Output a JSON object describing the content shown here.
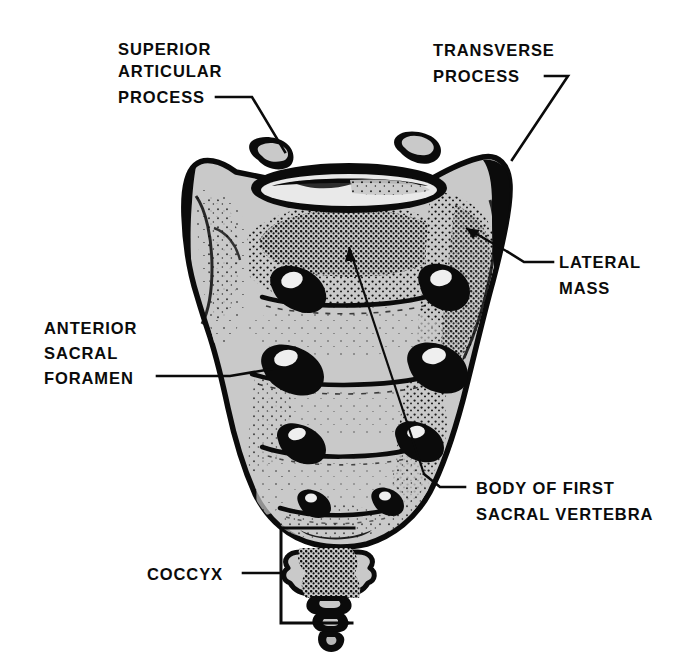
{
  "figure": {
    "background_color": "#ffffff",
    "bone_fill_color": "#c9c9c9",
    "ink_color": "#0b0b0b"
  },
  "labels": {
    "superior_articular_process": {
      "line1": "SUPERIOR",
      "line2": "ARTICULAR",
      "line3": "PROCESS"
    },
    "transverse_process": {
      "line1": "TRANSVERSE",
      "line2": "PROCESS"
    },
    "lateral_mass": {
      "line1": "LATERAL",
      "line2": "MASS"
    },
    "anterior_sacral_foramen": {
      "line1": "ANTERIOR",
      "line2": "SACRAL",
      "line3": "FORAMEN"
    },
    "body_of_first_sacral_vertebra": {
      "line1": "BODY OF FIRST",
      "line2": "SACRAL VERTEBRA"
    },
    "coccyx": {
      "line1": "COCCYX"
    }
  }
}
